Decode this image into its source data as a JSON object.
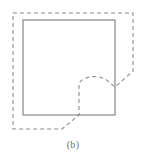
{
  "figure": {
    "caption": "(b)",
    "colors": {
      "background": "#ffffff",
      "solid_stroke": "#7d7d7d",
      "dashed_stroke": "#8c8c8c",
      "caption_text": "#6e6e6e"
    },
    "solid_square": {
      "name": "solid-square-region",
      "x": 23,
      "y": 20,
      "width": 92,
      "height": 95,
      "stroke_width": 1.1
    },
    "dashed_contour": {
      "name": "dashed-boundary-contour",
      "stroke_width": 1.1,
      "dash_pattern": "4,3",
      "path": "M 13 13 L 133 13 L 133 71 L 115 87 L 110 83 C 104 75 86 74 79 83 L 79 115 L 62 129 L 13 129 Z"
    }
  },
  "chart_data": {
    "type": "diagram",
    "title": "(b)",
    "elements": [
      {
        "name": "solid-square",
        "style": "solid",
        "color": "#7d7d7d",
        "points": [
          [
            23,
            20
          ],
          [
            115,
            20
          ],
          [
            115,
            115
          ],
          [
            23,
            115
          ]
        ]
      },
      {
        "name": "dashed-contour",
        "style": "dashed",
        "color": "#8c8c8c",
        "points": [
          [
            13,
            13
          ],
          [
            133,
            13
          ],
          [
            133,
            71
          ],
          [
            115,
            87
          ],
          [
            110,
            83
          ],
          [
            79,
            83
          ],
          [
            79,
            115
          ],
          [
            62,
            129
          ],
          [
            13,
            129
          ]
        ]
      }
    ]
  }
}
